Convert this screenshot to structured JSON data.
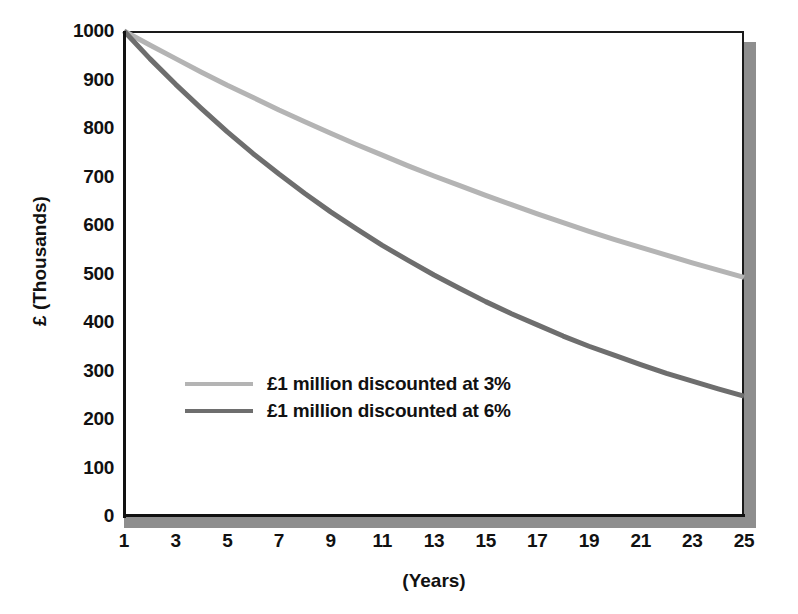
{
  "chart_data": {
    "type": "line",
    "title": "",
    "xlabel": "(Years)",
    "ylabel": "£ (Thousands)",
    "xlim": [
      1,
      25
    ],
    "ylim": [
      0,
      1000
    ],
    "grid": false,
    "legend_position": "center-left-inside",
    "x": [
      1,
      2,
      3,
      4,
      5,
      6,
      7,
      8,
      9,
      10,
      11,
      12,
      13,
      14,
      15,
      16,
      17,
      18,
      19,
      20,
      21,
      22,
      23,
      24,
      25
    ],
    "xticks": [
      "1",
      "3",
      "5",
      "7",
      "9",
      "11",
      "13",
      "15",
      "17",
      "19",
      "21",
      "23",
      "25"
    ],
    "xtick_values": [
      1,
      3,
      5,
      7,
      9,
      11,
      13,
      15,
      17,
      19,
      21,
      23,
      25
    ],
    "yticks": [
      "1000",
      "900",
      "800",
      "700",
      "600",
      "500",
      "400",
      "300",
      "200",
      "100",
      "0"
    ],
    "ytick_values": [
      1000,
      900,
      800,
      700,
      600,
      500,
      400,
      300,
      200,
      100,
      0
    ],
    "series": [
      {
        "name": "£1 million discounted at 3%",
        "color": "#b4b4b4",
        "values": [
          1000,
          971,
          943,
          915,
          888,
          863,
          837,
          813,
          789,
          766,
          744,
          722,
          701,
          681,
          661,
          642,
          623,
          605,
          587,
          570,
          554,
          538,
          522,
          507,
          492
        ]
      },
      {
        "name": "£1 million discounted at 6%",
        "color": "#6e6e6e",
        "values": [
          1000,
          943,
          890,
          840,
          792,
          747,
          705,
          665,
          627,
          592,
          558,
          527,
          497,
          469,
          442,
          417,
          394,
          371,
          350,
          331,
          312,
          294,
          278,
          262,
          247
        ]
      }
    ],
    "rendered_endpoints": {
      "series_3pct_year25": 450,
      "series_6pct_year25": 210
    }
  },
  "legend": {
    "items": [
      {
        "label": "£1 million discounted at 3%",
        "color": "#b4b4b4"
      },
      {
        "label": "£1 million discounted at 6%",
        "color": "#6e6e6e"
      }
    ]
  },
  "axes": {
    "y_title": "£ (Thousands)",
    "x_title": "(Years)"
  },
  "colors": {
    "axis": "#111111",
    "shadow": "#8e8e8e",
    "background": "#ffffff",
    "series_light": "#b4b4b4",
    "series_dark": "#6e6e6e"
  }
}
